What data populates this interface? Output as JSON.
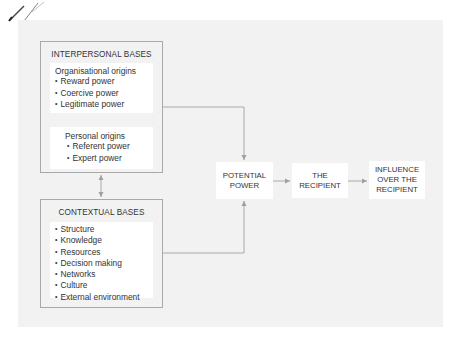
{
  "diagram": {
    "interpersonal": {
      "title": "INTERPERSONAL BASES",
      "organisational": {
        "heading": "Organisational origins",
        "items": [
          "Reward power",
          "Coercive power",
          "Legitimate power"
        ]
      },
      "personal": {
        "heading": "Personal origins",
        "items": [
          "Referent power",
          "Expert power"
        ]
      }
    },
    "contextual": {
      "title": "CONTEXTUAL BASES",
      "items": [
        "Structure",
        "Knowledge",
        "Resources",
        "Decision making",
        "Networks",
        "Culture",
        "External environment"
      ]
    },
    "nodes": {
      "potential_power": "POTENTIAL\nPOWER",
      "recipient": "THE\nRECIPIENT",
      "influence": "INFLUENCE\nOVER THE\nRECIPIENT"
    },
    "colors": {
      "panel": "#f2f2f2",
      "box_border": "#a9a9a9",
      "connector": "#a0a0a0",
      "text": "#333333"
    }
  }
}
